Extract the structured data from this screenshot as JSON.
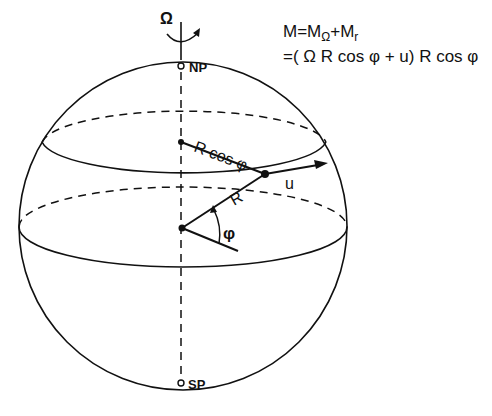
{
  "figure": {
    "rotation_symbol": "Ω",
    "north_pole_label": "NP",
    "south_pole_label": "SP",
    "label_r_cos_phi": "R cos φ",
    "label_u": "u",
    "label_r": "R",
    "label_phi": "φ",
    "stroke_color": "#111111",
    "background_color": "#ffffff"
  },
  "equation": {
    "line1_m": "M",
    "line1_eq": "=M",
    "line1_sub_omega": "Ω",
    "line1_plus": "+M",
    "line1_sub_r": "r",
    "line2": "=( Ω R  cos φ + u)  R cos φ"
  }
}
